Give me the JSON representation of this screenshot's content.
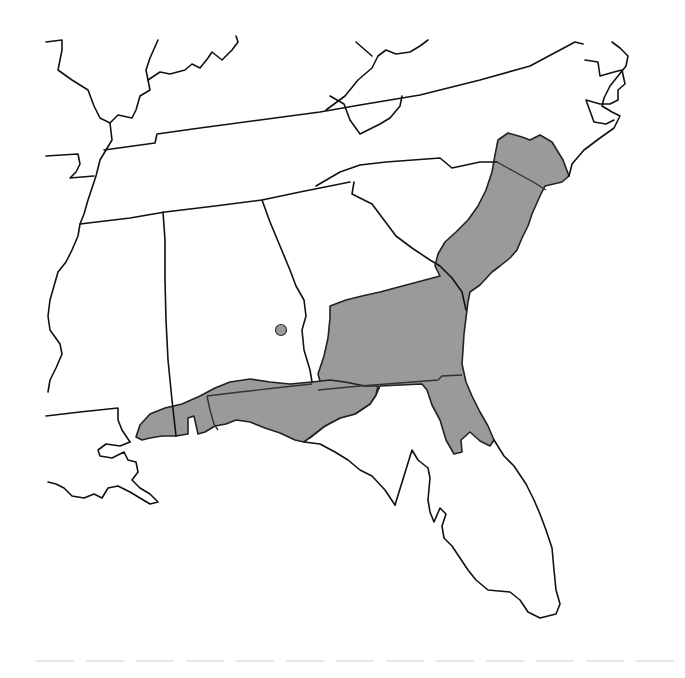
{
  "map": {
    "type": "species-range-map",
    "region": "Southeastern United States",
    "states_outlined": [
      "Arkansas",
      "Louisiana",
      "Mississippi",
      "Alabama",
      "Tennessee",
      "Kentucky",
      "Virginia",
      "North Carolina",
      "South Carolina",
      "Georgia",
      "Florida"
    ],
    "colors": {
      "background": "#ffffff",
      "range_fill": "#9a9a9a",
      "border": "#111111"
    },
    "range_regions": [
      {
        "name": "Atlantic Coastal Plain (NC–SC–GA)",
        "shaded": true
      },
      {
        "name": "Georgia Coastal Plain",
        "shaded": true
      },
      {
        "name": "Northeast Florida peninsula",
        "shaded": true
      },
      {
        "name": "Gulf Coast (MS–AL–FL panhandle)",
        "shaded": true
      }
    ],
    "isolated_localities": [
      {
        "name": "Central Alabama record",
        "x": 281,
        "y": 330
      }
    ]
  }
}
